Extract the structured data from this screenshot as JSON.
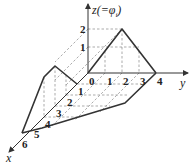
{
  "diagram": {
    "axes": {
      "x_label": "x",
      "y_label": "y",
      "z_label": "z(=φ",
      "z_label_sub": "i",
      "z_label_close": ")"
    },
    "y_ticks": [
      "0",
      "1",
      "2",
      "3",
      "4"
    ],
    "x_ticks": [
      "1",
      "2",
      "3",
      "4",
      "5",
      "6"
    ],
    "z_ticks": [
      "1",
      "2"
    ],
    "surface": {
      "description": "Pyramid-like piecewise linear function over a quadrilateral domain",
      "peak_z": 2,
      "y_range": [
        0,
        4
      ],
      "x_range": [
        0,
        6
      ]
    }
  }
}
